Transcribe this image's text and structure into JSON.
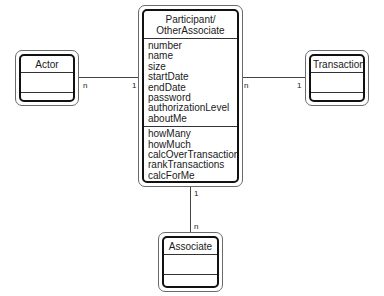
{
  "caption_fragment": "(Figure 3)",
  "classes": {
    "main": {
      "name": "Participant/\nOtherAssociate",
      "name_line1": "Participant/",
      "name_line2": "OtherAssociate",
      "attributes": [
        "number",
        "name",
        "size",
        "startDate",
        "endDate",
        "password",
        "authorizationLevel",
        "aboutMe"
      ],
      "operations": [
        "howMany",
        "howMuch",
        "calcOverTransactions",
        "rankTransactions",
        "calcForMe",
        "rateMe"
      ]
    },
    "actor": {
      "name": "Actor"
    },
    "transaction": {
      "name": "Transaction"
    },
    "associate": {
      "name": "Associate"
    }
  },
  "associations": [
    {
      "from": "Actor",
      "to": "Participant/OtherAssociate",
      "from_mult": "n",
      "to_mult": "1"
    },
    {
      "from": "Participant/OtherAssociate",
      "to": "Transaction",
      "from_mult": "n",
      "to_mult": "1"
    },
    {
      "from": "Participant/OtherAssociate",
      "to": "Associate",
      "from_mult": "1",
      "to_mult": "n"
    }
  ]
}
